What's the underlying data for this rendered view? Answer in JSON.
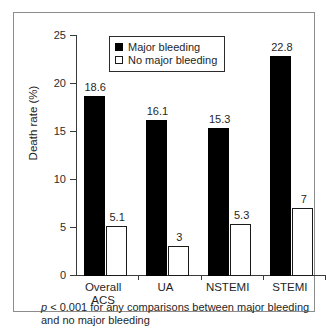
{
  "chart_data": {
    "type": "bar",
    "title": "",
    "xlabel": "",
    "ylabel": "Death rate (%)",
    "ylim": [
      0,
      25
    ],
    "yticks": [
      0,
      5,
      10,
      15,
      20,
      25
    ],
    "ytick_labels": [
      "0",
      "5",
      "10",
      "15",
      "20",
      "25"
    ],
    "grid": false,
    "legend_position": "top-center",
    "categories": [
      "Overall\nACS",
      "UA",
      "NSTEMI",
      "STEMI"
    ],
    "series": [
      {
        "name": "Major bleeding",
        "style": "filled-black",
        "values": [
          18.6,
          16.1,
          15.3,
          22.8
        ],
        "value_labels": [
          "18.6",
          "16.1",
          "15.3",
          "22.8"
        ]
      },
      {
        "name": "No major bleeding",
        "style": "open-white",
        "values": [
          5.1,
          3,
          5.3,
          7
        ],
        "value_labels": [
          "5.1",
          "3",
          "5.3",
          "7"
        ]
      }
    ],
    "annotations": [
      {
        "id": "p-value-note",
        "italic_prefix": "p",
        "text": " < 0.001 for any comparisons between major bleeding and no major bleeding"
      }
    ]
  },
  "legend": {
    "items": [
      {
        "label": "Major bleeding",
        "style": "filled"
      },
      {
        "label": "No major bleeding",
        "style": "open"
      }
    ]
  },
  "axes": {
    "y_title": "Death rate (%)",
    "y_tick_labels": [
      "25",
      "20",
      "15",
      "10",
      "5",
      "0"
    ],
    "x_tick_labels": [
      "Overall\nACS",
      "UA",
      "NSTEMI",
      "STEMI"
    ]
  },
  "footnote": {
    "italic_part": "p",
    "rest": " < 0.001 for any comparisons between major bleeding and no major bleeding"
  },
  "colors": {
    "major_bleeding": "#000000",
    "no_major_bleeding": "#ffffff",
    "axis": "#3a3a3a",
    "frame": "#8c8c8c",
    "text": "#1f1f1f"
  }
}
